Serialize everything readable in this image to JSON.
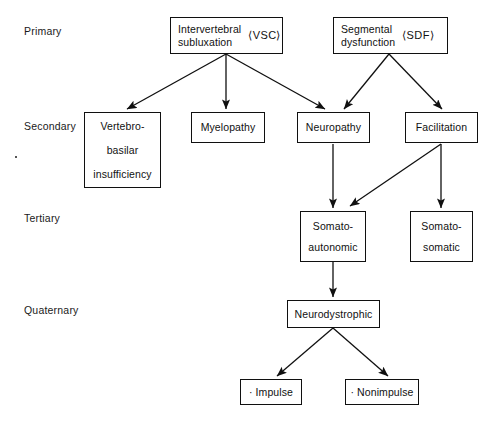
{
  "diagram": {
    "stage_labels": [
      {
        "id": "primary",
        "text": "Primary"
      },
      {
        "id": "secondary",
        "text": "Secondary"
      },
      {
        "id": "tertiary",
        "text": "Tertiary"
      },
      {
        "id": "quaternary",
        "text": "Quaternary"
      }
    ],
    "nodes": [
      {
        "id": "vsc",
        "text": "Intervertebral\nsubluxation",
        "acronym": "⟨VSC⟩"
      },
      {
        "id": "sdf",
        "text": "Segmental\ndysfunction",
        "acronym": "⟨SDF⟩"
      },
      {
        "id": "vertebrobasilar",
        "text": "Vertebro-\nbasilar\ninsufficiency"
      },
      {
        "id": "myelopathy",
        "text": "Myelopathy"
      },
      {
        "id": "neuropathy",
        "text": "Neuropathy"
      },
      {
        "id": "facilitation",
        "text": "Facilitation"
      },
      {
        "id": "somatoautonomic",
        "text": "Somato-\nautonomic"
      },
      {
        "id": "somatosomatic",
        "text": "Somato-\nsomatic"
      },
      {
        "id": "neurodystrophic",
        "text": "Neurodystrophic"
      },
      {
        "id": "impulse",
        "text": "· Impulse"
      },
      {
        "id": "nonimpulse",
        "text": "· Nonimpulse"
      }
    ],
    "edges": [
      {
        "from": "vsc",
        "to": "vertebrobasilar"
      },
      {
        "from": "vsc",
        "to": "myelopathy"
      },
      {
        "from": "vsc",
        "to": "neuropathy"
      },
      {
        "from": "sdf",
        "to": "neuropathy"
      },
      {
        "from": "sdf",
        "to": "facilitation"
      },
      {
        "from": "neuropathy",
        "to": "somatoautonomic"
      },
      {
        "from": "facilitation",
        "to": "somatoautonomic"
      },
      {
        "from": "facilitation",
        "to": "somatosomatic"
      },
      {
        "from": "somatoautonomic",
        "to": "neurodystrophic"
      },
      {
        "from": "neurodystrophic",
        "to": "impulse"
      },
      {
        "from": "neurodystrophic",
        "to": "nonimpulse"
      }
    ],
    "colors": {
      "background": "#ffffff",
      "line": "#101010",
      "text": "#111111"
    }
  }
}
